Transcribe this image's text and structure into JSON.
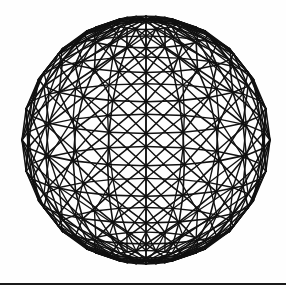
{
  "figure": {
    "kind": "geodesic-wireframe-sphere",
    "background_color": "#ffffff",
    "line_color": "#111111",
    "geometry": {
      "center_x": 146,
      "center_y": 140,
      "radius": 124,
      "meridians": 20,
      "parallels": 12,
      "diagonals": "both",
      "stroke_width": 1.6,
      "tilt_degrees": 12
    },
    "rule": {
      "y": 283,
      "thickness": 2,
      "color": "#1a1a1a",
      "width": 286
    }
  }
}
